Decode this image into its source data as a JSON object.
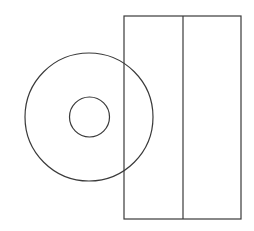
{
  "diagram": {
    "background": "#ffffff",
    "stroke_color": "#3a3a3a",
    "shapes": [
      {
        "type": "circle",
        "name": "outer-circle",
        "cx": 89,
        "cy": 117,
        "r": 64
      },
      {
        "type": "circle",
        "name": "inner-circle",
        "cx": 89.5,
        "cy": 117,
        "r": 20
      },
      {
        "type": "rect",
        "name": "outer-rectangle",
        "x": 124,
        "y": 16,
        "width": 117,
        "height": 203
      },
      {
        "type": "line",
        "name": "divider-line",
        "x1": 183,
        "y1": 16,
        "x2": 183,
        "y2": 219
      }
    ]
  }
}
